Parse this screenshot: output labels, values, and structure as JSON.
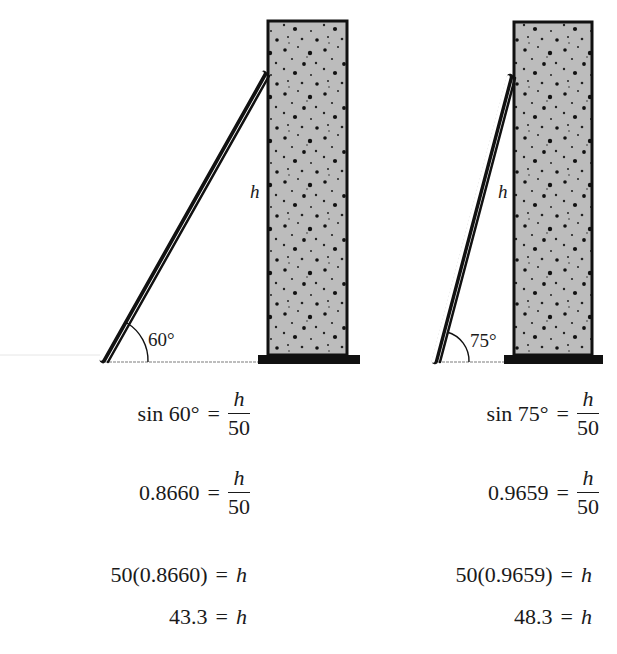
{
  "colors": {
    "wall_fill": "#b8b8b8",
    "wall_outline": "#111111",
    "ground": "#bdbdbd",
    "ladder_rail": "#111111",
    "ladder_side": "#ffffff",
    "text": "#1a1a1a"
  },
  "left_scene": {
    "angle_label": "60°",
    "height_label": "h",
    "angle_deg": 60,
    "ladder_length": 50
  },
  "right_scene": {
    "angle_label": "75°",
    "height_label": "h",
    "angle_deg": 75,
    "ladder_length": 50
  },
  "left_equations": {
    "eq1": {
      "lhs": "sin 60°",
      "op": "=",
      "num": "h",
      "den": "50"
    },
    "eq2": {
      "lhs": "0.8660",
      "op": "=",
      "num": "h",
      "den": "50"
    },
    "eq3": {
      "lhs": "50(0.8660)",
      "op": "=",
      "rhs": "h"
    },
    "eq4": {
      "lhs": "43.3",
      "op": "=",
      "rhs": "h"
    }
  },
  "right_equations": {
    "eq1": {
      "lhs": "sin 75°",
      "op": "=",
      "num": "h",
      "den": "50"
    },
    "eq2": {
      "lhs": "0.9659",
      "op": "=",
      "num": "h",
      "den": "50"
    },
    "eq3": {
      "lhs": "50(0.9659)",
      "op": "=",
      "rhs": "h"
    },
    "eq4": {
      "lhs": "48.3",
      "op": "=",
      "rhs": "h"
    }
  }
}
